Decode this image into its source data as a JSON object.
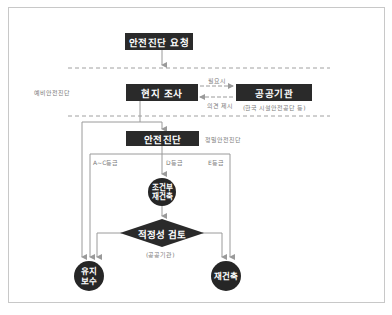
{
  "diagram": {
    "title_node": "안전진단 요청",
    "stages": {
      "preliminary": "예비안전진단",
      "detailed": "정밀안전진단"
    },
    "nodes": {
      "site_survey": "현지 조사",
      "public_agency": "공공기관",
      "public_agency_note": "(한국 시설안전공단 등)",
      "safety_diagnosis": "안전진단",
      "conditional_rebuild_line1": "조건부",
      "conditional_rebuild_line2": "재건축",
      "adequacy_review": "적정성 검토",
      "adequacy_review_note": "(공공기관)",
      "maintenance_line1": "유지",
      "maintenance_line2": "보수",
      "rebuild": "재건축"
    },
    "edges": {
      "when_needed": "필요시",
      "opinion_submitted": "의견 제시",
      "grade_ac": "A~C등급",
      "grade_d": "D등급",
      "grade_e": "E등급"
    },
    "colors": {
      "node_fill": "#2a2a2a",
      "line": "#9a9a9a",
      "label": "#7a7a7a",
      "frame": "#c8c8c8"
    }
  }
}
